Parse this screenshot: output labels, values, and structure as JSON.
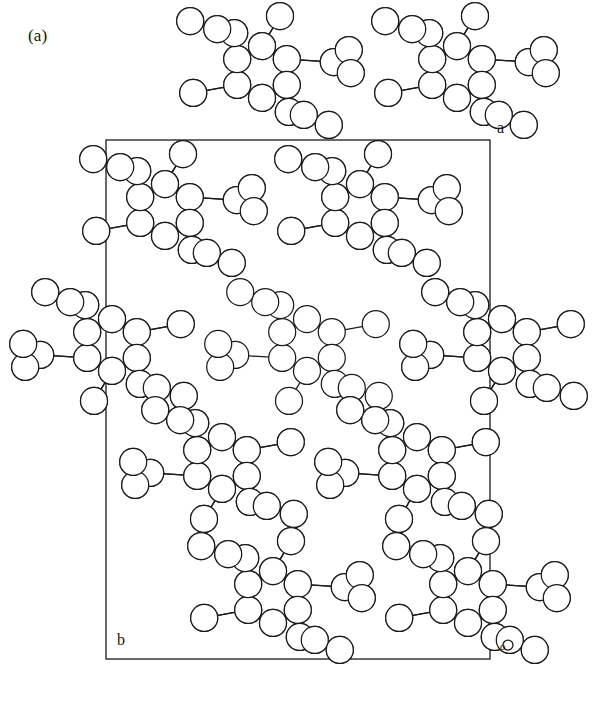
{
  "figure": {
    "panel_label": "(a)",
    "caption_type": "crystal-packing-diagram",
    "background_color": "#ffffff",
    "line_color": "#1a1a1a",
    "atom_fill_color": "#ffffff"
  },
  "axes": {
    "a_label": "a",
    "b_label": "b",
    "origin_label": "o"
  },
  "unit_cell": {
    "x": 106,
    "y": 140,
    "width": 384,
    "height": 519,
    "stroke_width": 1.3
  },
  "render": {
    "atom_radius_large": 13.5,
    "atom_radius_small": 12.0,
    "atom_radius_tiny": 5.0,
    "bond_width": 1.25,
    "ring_radius": 27
  },
  "chart_data": {
    "type": "scatter",
    "title": "(a)",
    "xlabel": "b",
    "ylabel": "a",
    "annotations": [
      "a",
      "b",
      "o",
      "(a)"
    ],
    "molecule_count": 16,
    "orientations": [
      "A",
      "B"
    ],
    "molecule_positions": [
      {
        "id": "m01",
        "cx": 262,
        "cy": 72,
        "orientation": "A"
      },
      {
        "id": "m02",
        "cx": 457,
        "cy": 72,
        "orientation": "A"
      },
      {
        "id": "m03",
        "cx": 165,
        "cy": 210,
        "orientation": "A"
      },
      {
        "id": "m04",
        "cx": 360,
        "cy": 210,
        "orientation": "A"
      },
      {
        "id": "m05",
        "cx": 112,
        "cy": 345,
        "orientation": "B"
      },
      {
        "id": "m06",
        "cx": 307,
        "cy": 345,
        "orientation": "B"
      },
      {
        "id": "m07",
        "cx": 502,
        "cy": 345,
        "orientation": "B"
      },
      {
        "id": "m08",
        "cx": 222,
        "cy": 463,
        "orientation": "B"
      },
      {
        "id": "m09",
        "cx": 417,
        "cy": 463,
        "orientation": "B"
      },
      {
        "id": "m10",
        "cx": 273,
        "cy": 597,
        "orientation": "A"
      },
      {
        "id": "m11",
        "cx": 468,
        "cy": 597,
        "orientation": "A"
      }
    ]
  }
}
